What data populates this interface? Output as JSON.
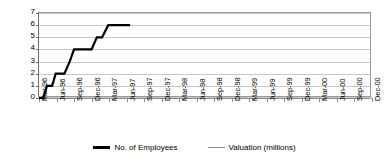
{
  "chart_data": {
    "type": "line",
    "title": "",
    "subtitle": "",
    "xlabel": "",
    "ylabel": "",
    "ylim": [
      0,
      7
    ],
    "yticks": [
      0,
      1,
      2,
      3,
      4,
      5,
      6,
      7
    ],
    "grid": true,
    "legend_position": "bottom",
    "categories": [
      "Mar-96",
      "Jun-96",
      "Sep-96",
      "Dec-96",
      "Mar-97",
      "Jun-97",
      "Sep-97",
      "Dec-97",
      "Mar-98",
      "Jun-98",
      "Sep-98",
      "Dec-98",
      "Mar-99",
      "Jun-99",
      "Sep-99",
      "Dec-99",
      "Mar-00",
      "Jun-00",
      "Sep-00",
      "Dec-00"
    ],
    "series": [
      {
        "name": "No. of Employees",
        "color": "#000000",
        "width": 2.2,
        "values": [
          0,
          2,
          4,
          4,
          6,
          6,
          null,
          null,
          null,
          null,
          null,
          null,
          null,
          null,
          null,
          null,
          null,
          null,
          null,
          null
        ],
        "step_points": [
          {
            "x": 0.0,
            "y": 0
          },
          {
            "x": 0.25,
            "y": 0
          },
          {
            "x": 0.45,
            "y": 1
          },
          {
            "x": 0.75,
            "y": 1
          },
          {
            "x": 0.95,
            "y": 2
          },
          {
            "x": 1.45,
            "y": 2
          },
          {
            "x": 1.75,
            "y": 3
          },
          {
            "x": 2.0,
            "y": 4
          },
          {
            "x": 3.0,
            "y": 4
          },
          {
            "x": 3.3,
            "y": 5
          },
          {
            "x": 3.6,
            "y": 5
          },
          {
            "x": 3.95,
            "y": 6
          },
          {
            "x": 5.2,
            "y": 6
          }
        ]
      },
      {
        "name": "Valuation (millions)",
        "color": "#8c8c8c",
        "width": 1,
        "values": [
          0,
          0,
          0,
          0,
          0,
          0,
          0,
          0,
          0,
          0,
          0,
          0,
          0,
          0,
          0,
          0,
          0,
          0,
          0,
          0
        ]
      }
    ]
  },
  "legend": {
    "entries": [
      {
        "label": "No. of Employees"
      },
      {
        "label": "Valuation (millions)"
      }
    ]
  },
  "axis": {
    "y_tick_labels": [
      "0",
      "1",
      "2",
      "3",
      "4",
      "5",
      "6",
      "7"
    ],
    "x_tick_labels": [
      "Mar-96",
      "Jun-96",
      "Sep-96",
      "Dec-96",
      "Mar-97",
      "Jun-97",
      "Sep-97",
      "Dec-97",
      "Mar-98",
      "Jun-98",
      "Sep-98",
      "Dec-98",
      "Mar-99",
      "Jun-99",
      "Sep-99",
      "Dec-99",
      "Mar-00",
      "Jun-00",
      "Sep-00",
      "Dec-00"
    ]
  }
}
